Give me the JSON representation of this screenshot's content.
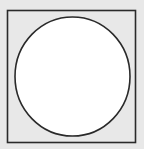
{
  "diagram": {
    "background_color": "#e8e8e8",
    "square": {
      "x": 7.5,
      "y": 10.5,
      "width": 128,
      "height": 132,
      "fill": "#e8e8e8",
      "stroke": "#2a2a2a",
      "stroke_width": 1.6
    },
    "circle": {
      "cx": 72.5,
      "cy": 76.5,
      "rx": 57.5,
      "ry": 59.5,
      "fill": "#ffffff",
      "stroke": "#2a2a2a",
      "stroke_width": 1.6
    }
  }
}
